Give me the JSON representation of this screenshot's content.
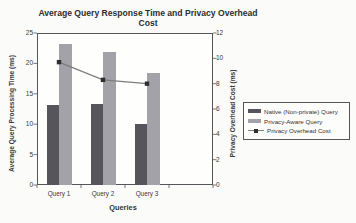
{
  "title": "Average Query Response Time and Privacy Overhead Cost",
  "chart_data": {
    "type": "bar",
    "subtype": "combo-bar-line-dual-axis",
    "title": "Average Query Response Time and Privacy Overhead Cost",
    "categories": [
      "Query 1",
      "Query 2",
      "Query 3"
    ],
    "xlabel": "Queries",
    "series": [
      {
        "name": "Native (Non-private) Query",
        "type": "bar",
        "axis": "left",
        "values": [
          13.2,
          13.3,
          10.0
        ],
        "color": "#55555b"
      },
      {
        "name": "Privacy-Aware Query",
        "type": "bar",
        "axis": "left",
        "values": [
          23.2,
          21.9,
          18.4
        ],
        "color": "#a2a2a8"
      },
      {
        "name": "Privacy Overhead Cost",
        "type": "line",
        "axis": "right",
        "values": [
          9.7,
          8.3,
          8.0
        ],
        "color": "#7d7d7d",
        "marker": "square",
        "marker_color": "#2f2f33"
      }
    ],
    "left_axis": {
      "label": "Average Query Processing Time (ms)",
      "min": 0,
      "max": 25,
      "ticks": [
        0,
        5,
        10,
        15,
        20,
        25
      ]
    },
    "right_axis": {
      "label": "Privacy Overhead Cost (ms)",
      "min": 0,
      "max": 12,
      "ticks": [
        0,
        2,
        4,
        6,
        8,
        10,
        12
      ]
    },
    "legend_position": "right",
    "grid": false,
    "layout": {
      "x_slots": 4,
      "bar_width_px": 12.5
    }
  },
  "colors": {
    "background": "#fbfbf9",
    "plot_background": "#fefefd",
    "frame": "#55555a",
    "text": "#3a3a3a"
  }
}
